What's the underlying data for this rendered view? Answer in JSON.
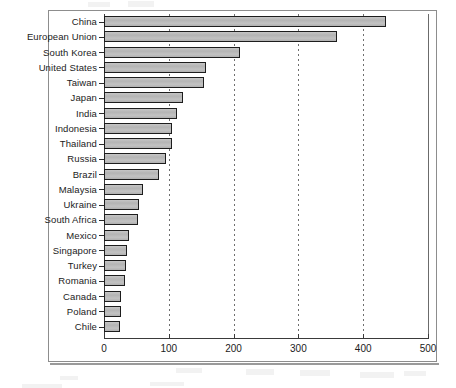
{
  "chart_data": {
    "type": "bar",
    "orientation": "horizontal",
    "title": "",
    "subtitle": "",
    "xlabel": "",
    "ylabel": "",
    "xlim": [
      0,
      500
    ],
    "xticks": [
      0,
      100,
      200,
      300,
      400,
      500
    ],
    "xtick_labels": [
      "0",
      "100",
      "200",
      "300",
      "400",
      "500"
    ],
    "grid": "vertical-dotted",
    "legend": "none",
    "series_name": "",
    "bar_face_color": "#bdbdbd",
    "bar_edge_color": "#1d1d1d",
    "categories": [
      "China",
      "European Union",
      "South Korea",
      "United States",
      "Taiwan",
      "Japan",
      "India",
      "Indonesia",
      "Thailand",
      "Russia",
      "Brazil",
      "Malaysia",
      "Ukraine",
      "South Africa",
      "Mexico",
      "Singapore",
      "Turkey",
      "Romania",
      "Canada",
      "Poland",
      "Chile"
    ],
    "values": [
      435,
      360,
      210,
      158,
      155,
      122,
      113,
      105,
      105,
      96,
      85,
      60,
      54,
      52,
      38,
      35,
      34,
      32,
      27,
      27,
      25
    ]
  }
}
